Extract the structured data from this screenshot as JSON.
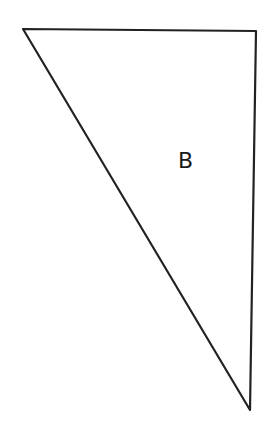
{
  "diagram": {
    "shape": "right-triangle",
    "label": "B",
    "vertices": [
      [
        23,
        29
      ],
      [
        256,
        31
      ],
      [
        250,
        410
      ]
    ],
    "stroke_color": "#222222",
    "label_position": [
      178,
      150
    ]
  }
}
